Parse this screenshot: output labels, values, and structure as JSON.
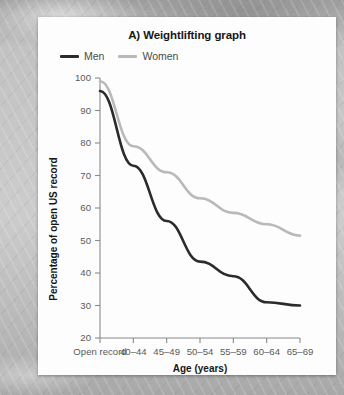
{
  "card": {
    "title": "A) Weightlifting graph"
  },
  "legend": {
    "position": "top-left",
    "items": [
      {
        "label": "Men",
        "color": "#2b2b2b"
      },
      {
        "label": "Women",
        "color": "#b9b9b9"
      }
    ]
  },
  "axes": {
    "xlabel": "Age (years)",
    "ylabel": "Percentage of open US record",
    "yticks": [
      "100",
      "90",
      "80",
      "70",
      "60",
      "50",
      "40",
      "30",
      "20"
    ],
    "xticks": [
      "Open record",
      "40–44",
      "45–49",
      "50–54",
      "55–59",
      "60–64",
      "65–69"
    ]
  },
  "chart_data": {
    "type": "line",
    "title": "A) Weightlifting graph",
    "xlabel": "Age (years)",
    "ylabel": "Percentage of open US record",
    "categories": [
      "Open record",
      "40–44",
      "45–49",
      "50–54",
      "55–59",
      "60–64",
      "65–69"
    ],
    "series": [
      {
        "name": "Men",
        "color": "#2b2b2b",
        "values": [
          96,
          73,
          56,
          43.5,
          39,
          31,
          30
        ]
      },
      {
        "name": "Women",
        "color": "#b9b9b9",
        "values": [
          99,
          79,
          71,
          63,
          58.5,
          55,
          51.5
        ]
      }
    ],
    "ylim": [
      20,
      100
    ],
    "ytick_step": 10,
    "grid": false,
    "legend_position": "top-left"
  }
}
